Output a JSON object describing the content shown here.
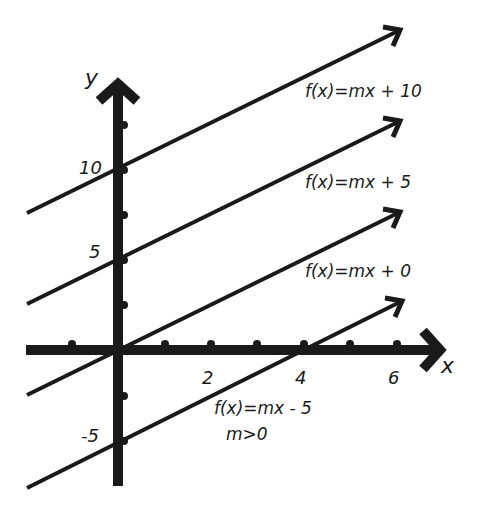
{
  "axes": {
    "x_label": "x",
    "y_label": "y",
    "x_ticks": [
      {
        "label": "2",
        "value": 2
      },
      {
        "label": "4",
        "value": 4
      },
      {
        "label": "6",
        "value": 6
      }
    ],
    "y_ticks": [
      {
        "label": "10",
        "value": 10
      },
      {
        "label": "5",
        "value": 5
      },
      {
        "label": "-5",
        "value": -5
      }
    ]
  },
  "lines": [
    {
      "label": "f(x)=mx + 10",
      "intercept": 10
    },
    {
      "label": "f(x)=mx + 5",
      "intercept": 5
    },
    {
      "label": "f(x)=mx + 0",
      "intercept": 0
    },
    {
      "label": "f(x)=mx - 5",
      "intercept": -5
    }
  ],
  "condition": "m>0",
  "colors": {
    "ink": "#1a1a1a",
    "background": "#ffffff"
  }
}
